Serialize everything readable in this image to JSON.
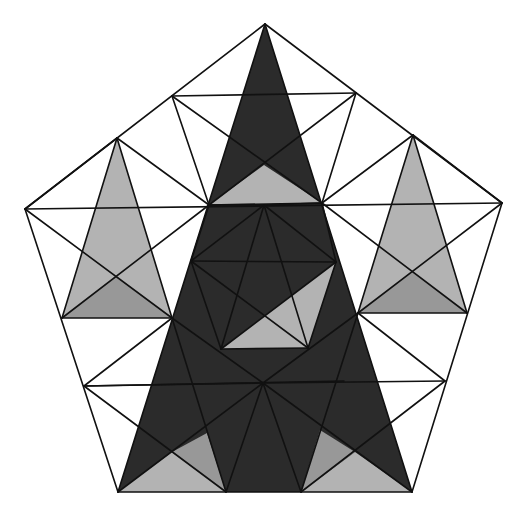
{
  "figure": {
    "title": "",
    "width": 524,
    "height": 515,
    "colors": {
      "background": "#ffffff",
      "dark": "#2b2b2b",
      "light_gray": "#b3b3b3",
      "mid_gray": "#989898",
      "stroke": "#111111"
    },
    "points": {
      "T": [
        265,
        24
      ],
      "L": [
        25,
        209
      ],
      "R": [
        502,
        203
      ],
      "BL": [
        118,
        492
      ],
      "BR": [
        412,
        492
      ],
      "mTL": [
        172,
        96
      ],
      "mTR": [
        356,
        93
      ],
      "qTL": [
        117,
        138
      ],
      "qTR": [
        413,
        135
      ],
      "nL": [
        209,
        205
      ],
      "nR": [
        322,
        203
      ],
      "nC": [
        264,
        165
      ],
      "sLL": [
        62,
        318
      ],
      "sLR": [
        172,
        318
      ],
      "xL": [
        117,
        276
      ],
      "sRL": [
        358,
        313
      ],
      "sRR": [
        467,
        313
      ],
      "xR": [
        413,
        272
      ],
      "mL": [
        84,
        386
      ],
      "mR": [
        445,
        381
      ],
      "bm1": [
        226,
        492
      ],
      "bm2": [
        301,
        492
      ],
      "C": [
        263,
        383
      ],
      "xBL": [
        172,
        452
      ],
      "xBR": [
        355,
        452
      ],
      "pT": [
        264,
        205
      ],
      "pL": [
        191,
        261
      ],
      "pR": [
        336,
        262
      ],
      "pBL": [
        221,
        349
      ],
      "pBR": [
        308,
        348
      ],
      "pX": [
        264,
        316
      ]
    },
    "fills": [
      {
        "name": "main-dark-triangle",
        "color": "dark",
        "pts": [
          "T",
          "BL",
          "BR"
        ]
      },
      {
        "name": "top-light-triangle",
        "color": "light_gray",
        "pts": [
          "nL",
          "nR",
          "nC"
        ]
      },
      {
        "name": "left-small-triangle",
        "color": "light_gray",
        "pts": [
          "qTL",
          "sLL",
          "sLR"
        ]
      },
      {
        "name": "left-small-lower",
        "color": "mid_gray",
        "pts": [
          "sLL",
          "sLR",
          "xL"
        ]
      },
      {
        "name": "right-small-triangle",
        "color": "light_gray",
        "pts": [
          "qTR",
          "sRL",
          "sRR"
        ]
      },
      {
        "name": "right-small-lower",
        "color": "mid_gray",
        "pts": [
          "sRL",
          "sRR",
          "xR"
        ]
      },
      {
        "name": "inner-light-triangle",
        "color": "light_gray",
        "pts": [
          "pBL",
          "pBR",
          "pR"
        ]
      },
      {
        "name": "bottom-left-light",
        "color": "light_gray",
        "pts": [
          "BL",
          "bm1",
          "xBL"
        ]
      },
      {
        "name": "bottom-left-mid",
        "color": "mid_gray",
        "pts": [
          "xBL",
          "bm1",
          [
            207,
            433
          ]
        ]
      },
      {
        "name": "bottom-right-light",
        "color": "light_gray",
        "pts": [
          "bm2",
          "BR",
          "xBR"
        ]
      },
      {
        "name": "bottom-right-mid",
        "color": "mid_gray",
        "pts": [
          "bm2",
          "xBR",
          [
            320,
            430
          ]
        ]
      }
    ],
    "lines": [
      [
        "T",
        "L"
      ],
      [
        "L",
        "BL"
      ],
      [
        "BL",
        "BR"
      ],
      [
        "BR",
        "R"
      ],
      [
        "R",
        "T"
      ],
      [
        "T",
        "BL"
      ],
      [
        "T",
        "BR"
      ],
      [
        "mTL",
        "mTR"
      ],
      [
        "mTL",
        "nR"
      ],
      [
        "mTR",
        "nL"
      ],
      [
        "mTL",
        "nL"
      ],
      [
        "mTR",
        "nR"
      ],
      [
        "L",
        "R"
      ],
      [
        "qTL",
        "L"
      ],
      [
        "qTL",
        "nL"
      ],
      [
        "qTL",
        "sLL"
      ],
      [
        "qTL",
        "sLR"
      ],
      [
        "qTR",
        "R"
      ],
      [
        "qTR",
        "nR"
      ],
      [
        "qTR",
        "sRL"
      ],
      [
        "qTR",
        "sRR"
      ],
      [
        "L",
        "sLR"
      ],
      [
        "nL",
        "sLL"
      ],
      [
        "sLL",
        "sLR"
      ],
      [
        "R",
        "sRL"
      ],
      [
        "nR",
        "sRR"
      ],
      [
        "sRL",
        "sRR"
      ],
      [
        "nL",
        "nR"
      ],
      [
        "sLR",
        "mL"
      ],
      [
        "mL",
        "C"
      ],
      [
        "mL",
        "bm1"
      ],
      [
        "sLR",
        "C"
      ],
      [
        "sLR",
        "bm1"
      ],
      [
        "mL",
        [
          344,
          381
        ]
      ],
      [
        "sRL",
        "mR"
      ],
      [
        "mR",
        "C"
      ],
      [
        "mR",
        "bm2"
      ],
      [
        "sRL",
        "C"
      ],
      [
        "sRL",
        "bm2"
      ],
      [
        "C",
        "bm1"
      ],
      [
        "C",
        "bm2"
      ],
      [
        "C",
        "BL"
      ],
      [
        "C",
        "BR"
      ],
      [
        "pT",
        "pL"
      ],
      [
        "pT",
        "pR"
      ],
      [
        "pL",
        "pR"
      ],
      [
        "pL",
        "pBL"
      ],
      [
        "pR",
        "pBR"
      ],
      [
        "pBL",
        "pBR"
      ],
      [
        "pT",
        "pBL"
      ],
      [
        "pT",
        "pBR"
      ],
      [
        "pL",
        "pBR"
      ],
      [
        "pR",
        "pBL"
      ],
      [
        "nL",
        "pT"
      ],
      [
        "nR",
        "pT"
      ],
      [
        "nL",
        "pL"
      ],
      [
        "nR",
        "pR"
      ]
    ],
    "stroke_width": 1.6
  }
}
